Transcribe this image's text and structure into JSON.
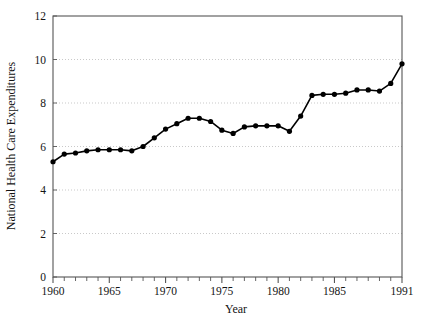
{
  "chart_data": {
    "type": "line",
    "title": "",
    "subtitle": "",
    "xlabel": "Year",
    "ylabel": "National Health Care Expenditures",
    "xlim": [
      1960,
      1991
    ],
    "ylim": [
      0,
      12
    ],
    "grid": "horizontal-dotted",
    "legend": "none",
    "marker": "filled-circle",
    "line_color": "#000000",
    "marker_color": "#000000",
    "grid_color": "#bbbbbb",
    "axis_color": "#555555",
    "background": "#ffffff",
    "xticks_major": [
      1960,
      1965,
      1970,
      1975,
      1980,
      1985,
      1991
    ],
    "xticks_major_labels": [
      "1960",
      "1965",
      "1970",
      "1975",
      "1980",
      "1985",
      "1991"
    ],
    "xticks_minor_step": 1,
    "yticks": [
      0,
      2,
      4,
      6,
      8,
      10,
      12
    ],
    "ytick_labels": [
      "0",
      "2",
      "4",
      "6",
      "8",
      "10",
      "12"
    ],
    "x": [
      1960,
      1961,
      1962,
      1963,
      1964,
      1965,
      1966,
      1967,
      1968,
      1969,
      1970,
      1971,
      1972,
      1973,
      1974,
      1975,
      1976,
      1977,
      1978,
      1979,
      1980,
      1981,
      1982,
      1983,
      1984,
      1985,
      1986,
      1987,
      1988,
      1989,
      1990,
      1991
    ],
    "values": [
      5.3,
      5.65,
      5.7,
      5.8,
      5.85,
      5.85,
      5.85,
      5.8,
      6.0,
      6.4,
      6.8,
      7.05,
      7.3,
      7.3,
      7.15,
      6.75,
      6.6,
      6.9,
      6.95,
      6.95,
      6.95,
      6.7,
      7.4,
      8.35,
      8.4,
      8.4,
      8.45,
      8.6,
      8.6,
      8.55,
      8.9,
      9.15
    ],
    "points": [
      {
        "year": 1960,
        "value": 5.3
      },
      {
        "year": 1961,
        "value": 5.65
      },
      {
        "year": 1962,
        "value": 5.7
      },
      {
        "year": 1963,
        "value": 5.8
      },
      {
        "year": 1964,
        "value": 5.85
      },
      {
        "year": 1965,
        "value": 5.85
      },
      {
        "year": 1966,
        "value": 5.85
      },
      {
        "year": 1967,
        "value": 5.8
      },
      {
        "year": 1968,
        "value": 6.0
      },
      {
        "year": 1969,
        "value": 6.4
      },
      {
        "year": 1970,
        "value": 6.8
      },
      {
        "year": 1971,
        "value": 7.05
      },
      {
        "year": 1972,
        "value": 7.3
      },
      {
        "year": 1973,
        "value": 7.3
      },
      {
        "year": 1974,
        "value": 7.15
      },
      {
        "year": 1975,
        "value": 6.75
      },
      {
        "year": 1976,
        "value": 6.6
      },
      {
        "year": 1977,
        "value": 6.9
      },
      {
        "year": 1978,
        "value": 6.95
      },
      {
        "year": 1979,
        "value": 6.95
      },
      {
        "year": 1980,
        "value": 6.95
      },
      {
        "year": 1981,
        "value": 6.7
      },
      {
        "year": 1982,
        "value": 7.4
      },
      {
        "year": 1983,
        "value": 8.35
      },
      {
        "year": 1984,
        "value": 8.4
      },
      {
        "year": 1985,
        "value": 8.4
      },
      {
        "year": 1986,
        "value": 8.45
      },
      {
        "year": 1987,
        "value": 8.6
      },
      {
        "year": 1988,
        "value": 8.6
      },
      {
        "year": 1989,
        "value": 8.55
      },
      {
        "year": 1990,
        "value": 8.9
      },
      {
        "year": 1991,
        "value": 9.8
      }
    ]
  }
}
